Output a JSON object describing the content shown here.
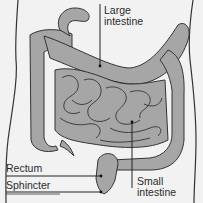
{
  "diagram": {
    "labels": {
      "large_intestine": "Large\nintestine",
      "small_intestine": "Small\nintestine",
      "rectum": "Rectum",
      "sphincter": "Sphincter"
    },
    "colors": {
      "background": "#f2f2f2",
      "organ_fill": "#a6a6a6",
      "outline": "#333333",
      "text": "#2a2a2a"
    }
  }
}
